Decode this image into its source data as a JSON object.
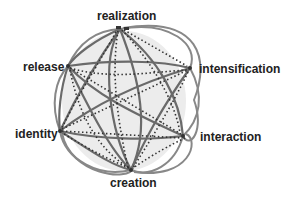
{
  "diagram": {
    "type": "circular-network",
    "nodes": [
      {
        "id": "realization",
        "label": "realization",
        "x": 120,
        "y": 29
      },
      {
        "id": "intensification",
        "label": "intensification",
        "x": 190,
        "y": 68
      },
      {
        "id": "interaction",
        "label": "interaction",
        "x": 183,
        "y": 136
      },
      {
        "id": "creation",
        "label": "creation",
        "x": 131,
        "y": 170
      },
      {
        "id": "identity",
        "label": "identity",
        "x": 60,
        "y": 131
      },
      {
        "id": "release",
        "label": "release",
        "x": 68,
        "y": 66
      }
    ],
    "edge_styles": {
      "solid": {
        "color": "#707070",
        "width": 2.2
      },
      "dotted": {
        "color": "#3a3a3a",
        "width": 1.6,
        "dash": "1.5 2.5"
      }
    },
    "background_fill": "#ececec"
  }
}
